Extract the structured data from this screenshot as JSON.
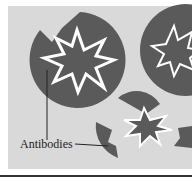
{
  "figure": {
    "label": "Antibodies",
    "colors": {
      "background": "#d9d9d9",
      "shape": "#5a5a5a",
      "outline": "#ffffff",
      "text": "#222222"
    }
  }
}
